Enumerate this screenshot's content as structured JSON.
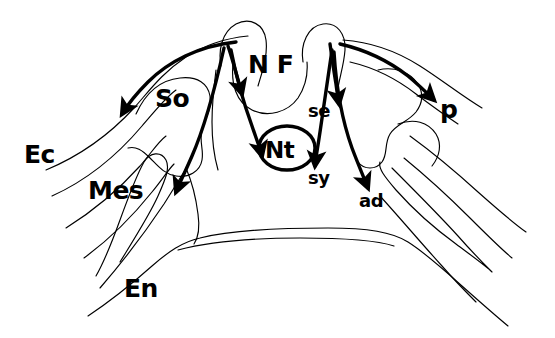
{
  "figure": {
    "background_color": "#ffffff",
    "line_color": "#000000",
    "width": 555,
    "height": 338
  },
  "labels": [
    {
      "id": "ec",
      "text": "Ec",
      "x": 24,
      "y": 163,
      "size": "lg",
      "meaning": "ectoderm"
    },
    {
      "id": "mes",
      "text": "Mes",
      "x": 88,
      "y": 199,
      "size": "lg",
      "meaning": "mesoderm"
    },
    {
      "id": "en",
      "text": "En",
      "x": 124,
      "y": 297,
      "size": "lg",
      "meaning": "endoderm"
    },
    {
      "id": "so",
      "text": "So",
      "x": 155,
      "y": 107,
      "size": "lg",
      "meaning": "somite"
    },
    {
      "id": "nf",
      "text": "N F",
      "x": 248,
      "y": 73,
      "size": "lg",
      "meaning": "neural fold"
    },
    {
      "id": "nt",
      "text": "Nt",
      "x": 265,
      "y": 158,
      "size": "md",
      "meaning": "notochord"
    },
    {
      "id": "se",
      "text": "se",
      "x": 308,
      "y": 117,
      "size": "sm",
      "meaning": "segmental plate"
    },
    {
      "id": "sy",
      "text": "sy",
      "x": 308,
      "y": 184,
      "size": "sm",
      "meaning": "somatic layer"
    },
    {
      "id": "ad",
      "text": "ad",
      "x": 359,
      "y": 207,
      "size": "sm",
      "meaning": "adaxial"
    },
    {
      "id": "p",
      "text": "p",
      "x": 440,
      "y": 118,
      "size": "lg",
      "meaning": "pronephros"
    }
  ],
  "arrows": [
    {
      "id": "arrow-to-ec-left",
      "target": "Ec / lateral ectoderm left"
    },
    {
      "id": "arrow-to-so",
      "target": "So somite left"
    },
    {
      "id": "arrow-to-mes-left",
      "target": "Mes mesoderm left"
    },
    {
      "id": "arrow-to-nt",
      "target": "Nt notochord"
    },
    {
      "id": "arrow-to-se",
      "target": "se segmental plate"
    },
    {
      "id": "arrow-to-sy",
      "target": "sy somatic layer"
    },
    {
      "id": "arrow-to-ad",
      "target": "ad adaxial"
    },
    {
      "id": "arrow-to-p",
      "target": "p pronephros"
    }
  ]
}
